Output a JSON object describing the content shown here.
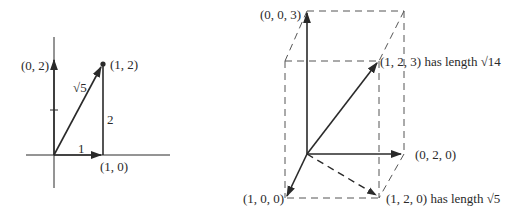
{
  "figure_2d": {
    "labels": {
      "point_0_2": "(0, 2)",
      "point_1_2": "(1, 2)",
      "point_1_0": "(1, 0)",
      "hypotenuse": "√5",
      "side_vertical": "2",
      "side_horizontal": "1"
    }
  },
  "figure_3d": {
    "labels": {
      "point_0_0_3": "(0, 0, 3)",
      "point_1_2_3": "(1, 2, 3) has length √14",
      "point_0_2_0": "(0, 2, 0)",
      "point_1_0_0": "(1, 0, 0)",
      "point_1_2_0": "(1, 2, 0) has length √5"
    }
  },
  "colors": {
    "line": "#2a2a2a",
    "dashed": "#555555",
    "background": "#ffffff"
  }
}
